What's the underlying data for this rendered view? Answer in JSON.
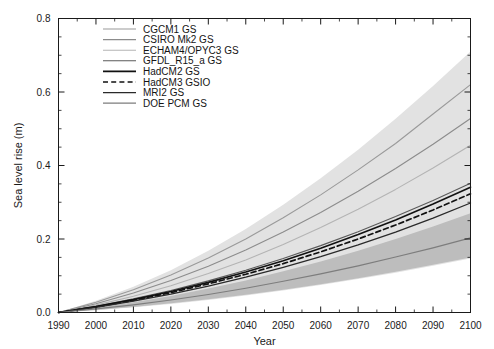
{
  "chart_data": {
    "type": "line",
    "title": "",
    "xlabel": "Year",
    "ylabel": "Sea level rise (m)",
    "xlim": [
      1990,
      2100
    ],
    "ylim": [
      0.0,
      0.8
    ],
    "xticks": [
      1990,
      2000,
      2010,
      2020,
      2030,
      2040,
      2050,
      2060,
      2070,
      2080,
      2090,
      2100
    ],
    "xtick_labels": [
      "1990",
      "2000",
      "2010",
      "2020",
      "2030",
      "2040",
      "2050",
      "2060",
      "2070",
      "2080",
      "2090",
      "2100"
    ],
    "yticks": [
      0.0,
      0.2,
      0.4,
      0.6,
      0.8
    ],
    "ytick_labels": [
      "0.0",
      "0.2",
      "0.4",
      "0.6",
      "0.8"
    ],
    "yminor_step": 0.05,
    "grid": false,
    "legend_position": "upper left",
    "x": [
      1990,
      2000,
      2010,
      2020,
      2030,
      2040,
      2050,
      2060,
      2070,
      2080,
      2090,
      2100
    ],
    "series": [
      {
        "name": "CGCM1 GS",
        "style": "solid",
        "color": "#9a9a9a",
        "width": 1.1,
        "values": [
          0.0,
          0.028,
          0.062,
          0.102,
          0.148,
          0.2,
          0.258,
          0.32,
          0.388,
          0.46,
          0.54,
          0.62
        ]
      },
      {
        "name": "CSIRO Mk2 GS",
        "style": "solid",
        "color": "#8c8c8c",
        "width": 1.1,
        "values": [
          0.0,
          0.024,
          0.053,
          0.087,
          0.126,
          0.17,
          0.219,
          0.272,
          0.33,
          0.392,
          0.458,
          0.528
        ]
      },
      {
        "name": "ECHAM4/OPYC3 GS",
        "style": "solid",
        "color": "#b4b4b4",
        "width": 1.1,
        "values": [
          0.0,
          0.02,
          0.044,
          0.073,
          0.106,
          0.143,
          0.185,
          0.231,
          0.281,
          0.335,
          0.393,
          0.455
        ]
      },
      {
        "name": "GFDL_R15_a GS",
        "style": "solid",
        "color": "#5a5a5a",
        "width": 1.1,
        "values": [
          0.0,
          0.017,
          0.037,
          0.06,
          0.086,
          0.115,
          0.147,
          0.182,
          0.22,
          0.261,
          0.305,
          0.352
        ]
      },
      {
        "name": "HadCM2 GS",
        "style": "solid",
        "color": "#111111",
        "width": 1.6,
        "values": [
          0.0,
          0.016,
          0.035,
          0.057,
          0.082,
          0.11,
          0.141,
          0.175,
          0.212,
          0.252,
          0.295,
          0.341
        ]
      },
      {
        "name": "HadCM3 GSIO",
        "style": "dashed",
        "color": "#111111",
        "width": 1.7,
        "values": [
          0.0,
          0.015,
          0.033,
          0.054,
          0.078,
          0.104,
          0.133,
          0.165,
          0.2,
          0.238,
          0.279,
          0.323
        ]
      },
      {
        "name": "MRI2 GS",
        "style": "solid",
        "color": "#2a2a2a",
        "width": 1.3,
        "values": [
          0.0,
          0.014,
          0.031,
          0.05,
          0.072,
          0.096,
          0.123,
          0.152,
          0.184,
          0.219,
          0.257,
          0.298
        ]
      },
      {
        "name": "DOE PCM GS",
        "style": "solid",
        "color": "#7d7d7d",
        "width": 1.2,
        "values": [
          0.0,
          0.01,
          0.021,
          0.034,
          0.049,
          0.066,
          0.085,
          0.105,
          0.127,
          0.151,
          0.176,
          0.203
        ]
      }
    ],
    "bands": [
      {
        "name": "full-range-envelope",
        "fill": "#e2e2e2",
        "upper": [
          0.0,
          0.032,
          0.07,
          0.115,
          0.168,
          0.227,
          0.293,
          0.365,
          0.443,
          0.527,
          0.616,
          0.71
        ],
        "lower": [
          0.0,
          0.006,
          0.014,
          0.023,
          0.034,
          0.046,
          0.06,
          0.075,
          0.091,
          0.108,
          0.127,
          0.147
        ]
      },
      {
        "name": "low-model-envelope",
        "fill": "#bdbdbd",
        "upper": [
          0.0,
          0.013,
          0.028,
          0.045,
          0.065,
          0.087,
          0.112,
          0.139,
          0.168,
          0.2,
          0.234,
          0.27
        ],
        "lower": [
          0.0,
          0.007,
          0.015,
          0.025,
          0.036,
          0.048,
          0.062,
          0.077,
          0.093,
          0.111,
          0.13,
          0.15
        ]
      }
    ]
  }
}
